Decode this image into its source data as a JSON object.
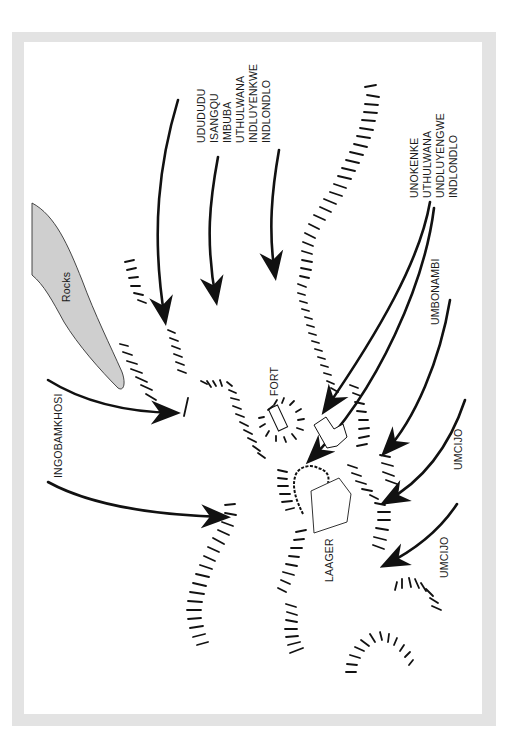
{
  "map": {
    "type": "battle-diagram",
    "colors": {
      "frame": "#e3e3e3",
      "background": "#ffffff",
      "rocks_fill": "#cfcfcf",
      "ink": "#111111"
    },
    "features": {
      "rocks": "Rocks",
      "fort": "FORT",
      "laager": "LAAGER"
    },
    "regiment_groups": {
      "center_north": [
        "UDUDUDU",
        "ISANGQU",
        "IMBUBA",
        "UTHULWANA",
        "INDLUYENKWE",
        "INDLONDLO"
      ],
      "north_east": [
        "UNOKENKE",
        "UTHULWANA",
        "UNDLUYENGWE",
        "INDLONDLO"
      ],
      "east": "UMBONAMBI",
      "south_east_1": "UMCIJO",
      "south_east_2": "UMCIJO",
      "west": "INGOBAMKHOSI"
    }
  }
}
